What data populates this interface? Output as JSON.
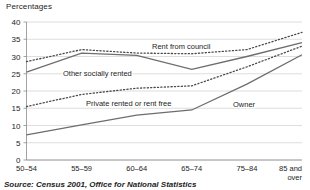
{
  "header": {
    "axis_title": "Percentages"
  },
  "footer": {
    "source": "Source: Census 2001, Office for National Statistics"
  },
  "axis": {
    "y_ticks": [
      "0",
      "5",
      "10",
      "15",
      "20",
      "25",
      "30",
      "35",
      "40"
    ],
    "x_labels": [
      "50–54",
      "55–59",
      "60–64",
      "65–74",
      "75–84",
      "85 and"
    ],
    "x_last_line2": "over"
  },
  "labels": {
    "rent_from_council": "Rent from council",
    "other_socially_rented": "Other socially rented",
    "private_rented_or_rent_free": "Private rented or rent free",
    "owner": "Owner"
  },
  "colors": {
    "solid_line": "#6d6d6d",
    "dotted_line": "#4a4a4a",
    "gridline": "#c8c8c8",
    "axis": "#8a8a8a",
    "text": "#1d1d1d",
    "background": "#ffffff"
  },
  "chart_data": {
    "type": "line",
    "title": "",
    "subtitle": "",
    "xlabel": "",
    "ylabel": "Percentages",
    "ylim": [
      0,
      40
    ],
    "y_ticks": [
      0,
      5,
      10,
      15,
      20,
      25,
      30,
      35,
      40
    ],
    "grid": true,
    "legend_position": "inline-annotations",
    "categories": [
      "50-54",
      "55-59",
      "60-64",
      "65-74",
      "75-84",
      "85 and over"
    ],
    "series": [
      {
        "name": "Rent from council",
        "style": "dotted",
        "values": [
          28.5,
          32.0,
          31.0,
          30.8,
          32.0,
          37.0
        ]
      },
      {
        "name": "Other socially rented",
        "style": "solid",
        "values": [
          25.5,
          31.0,
          30.3,
          26.3,
          30.0,
          34.0
        ]
      },
      {
        "name": "Private rented or rent free",
        "style": "dotted",
        "values": [
          15.5,
          19.0,
          20.8,
          21.5,
          27.0,
          33.0
        ]
      },
      {
        "name": "Owner",
        "style": "solid",
        "values": [
          7.3,
          10.2,
          13.0,
          14.5,
          22.0,
          30.5
        ]
      }
    ]
  }
}
